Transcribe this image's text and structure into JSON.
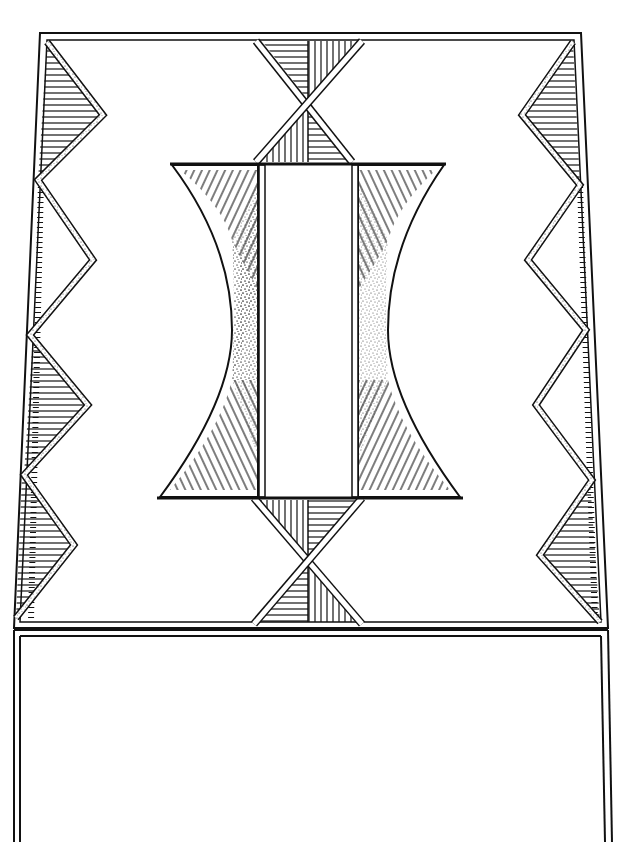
{
  "artwork": {
    "title": "Geometric painted panel design",
    "style": "black-and-white line drawing",
    "colors": {
      "ink": "#111111",
      "paper": "#ffffff",
      "stipple": "#333333"
    },
    "motifs": {
      "top_tie_circles_pairs": 3,
      "border_triangles_top_left": 7,
      "border_triangles_top_right": 6,
      "border_triangles_bottom_left": 6,
      "border_triangles_bottom_right": 6,
      "side_zigzag_peaks_per_side": 4,
      "central_figure": "hourglass with serrated edges",
      "hourglass_connectors": 2,
      "lower_panel": "blank"
    }
  }
}
